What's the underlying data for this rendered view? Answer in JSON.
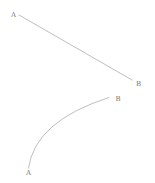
{
  "diagram": {
    "background_color": "#ffffff",
    "stroke_color": "#adadad",
    "label_color": "#7a7a7a",
    "straight_segment": {
      "type": "line",
      "x1": 19,
      "y1": 15,
      "x2": 132,
      "y2": 80,
      "start_label": {
        "text": "A",
        "x": 13.5,
        "y": 16.5
      },
      "end_label": {
        "text": "B",
        "x": 138.5,
        "y": 85.5
      }
    },
    "curved_segment": {
      "type": "quadratic-arc",
      "d": "M 109 97.5 Q 35 121 28.5 168",
      "start_label": {
        "text": "B",
        "x": 118,
        "y": 101
      },
      "end_label": {
        "text": "A",
        "x": 28.5,
        "y": 175
      }
    }
  }
}
